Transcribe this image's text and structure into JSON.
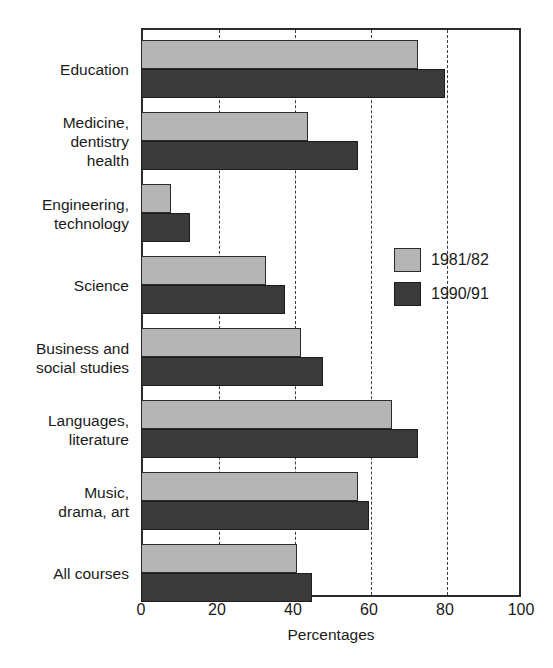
{
  "chart_data": {
    "type": "bar",
    "orientation": "horizontal",
    "title": "",
    "xlabel": "Percentages",
    "ylabel": "",
    "xlim": [
      0,
      100
    ],
    "xticks": [
      0,
      20,
      40,
      60,
      80,
      100
    ],
    "grid": "vertical-dashed",
    "legend_position": "inside-right",
    "categories": [
      "Education",
      "Medicine,\ndentistry\nhealth",
      "Engineering,\ntechnology",
      "Science",
      "Business and\nsocial studies",
      "Languages,\nliterature",
      "Music,\ndrama, art",
      "All courses"
    ],
    "series": [
      {
        "name": "1981/82",
        "color": "#b5b5b5",
        "values": [
          73,
          44,
          8,
          33,
          42,
          66,
          57,
          41
        ]
      },
      {
        "name": "1990/91",
        "color": "#3a3a3a",
        "values": [
          80,
          57,
          13,
          38,
          48,
          73,
          60,
          45
        ]
      }
    ]
  },
  "axis": {
    "x_title": "Percentages",
    "tick_labels": [
      "0",
      "20",
      "40",
      "60",
      "80",
      "100"
    ]
  },
  "legend": {
    "items": [
      {
        "label": "1981/82",
        "swatch": "light-gray-swatch"
      },
      {
        "label": "1990/91",
        "swatch": "dark-gray-swatch"
      }
    ]
  },
  "colors": {
    "series_1981": "#b5b5b5",
    "series_1990": "#3a3a3a",
    "frame": "#2b2b2b",
    "background": "#ffffff"
  }
}
